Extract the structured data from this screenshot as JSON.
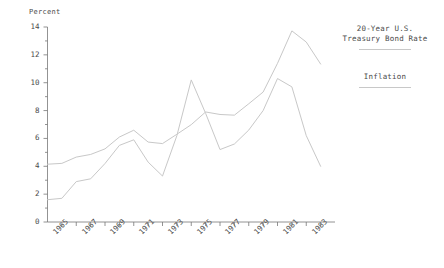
{
  "chart_data": {
    "type": "line",
    "title": "",
    "xlabel": "",
    "ylabel": "Percent",
    "xlim": [
      1964,
      1984
    ],
    "ylim": [
      0,
      14
    ],
    "grid": false,
    "legend_position": "right",
    "x": [
      1964,
      1965,
      1966,
      1967,
      1968,
      1969,
      1970,
      1971,
      1972,
      1973,
      1974,
      1975,
      1976,
      1977,
      1978,
      1979,
      1980,
      1981,
      1982,
      1983
    ],
    "xtick_labels": [
      "1965",
      "1967",
      "1969",
      "1971",
      "1973",
      "1975",
      "1977",
      "1979",
      "1981",
      "1983"
    ],
    "xtick_values": [
      1965,
      1967,
      1969,
      1971,
      1973,
      1975,
      1977,
      1979,
      1981,
      1983
    ],
    "ytick_labels": [
      "0",
      "2",
      "4",
      "6",
      "8",
      "10",
      "12",
      "14"
    ],
    "ytick_values": [
      0,
      2,
      4,
      6,
      8,
      10,
      12,
      14
    ],
    "yminor_values": [
      1,
      3,
      5,
      7,
      9,
      11,
      13
    ],
    "series": [
      {
        "name": "20-Year U.S. Treasury Bond Rate",
        "color": "#c8c8c8",
        "values": [
          4.15,
          4.21,
          4.66,
          4.85,
          5.25,
          6.1,
          6.59,
          5.74,
          5.63,
          6.3,
          6.99,
          7.9,
          7.72,
          7.67,
          8.49,
          9.33,
          11.39,
          13.72,
          12.92,
          11.34
        ]
      },
      {
        "name": "Inflation",
        "color": "#c8c8c8",
        "values": [
          1.6,
          1.7,
          2.9,
          3.1,
          4.2,
          5.5,
          5.9,
          4.3,
          3.3,
          6.2,
          10.2,
          7.8,
          5.2,
          5.6,
          6.6,
          8.0,
          10.3,
          9.7,
          6.2,
          4.0
        ]
      }
    ]
  },
  "legend": {
    "entries": [
      {
        "line1": "20-Year U.S.",
        "line2": "Treasury Bond Rate"
      },
      {
        "line1": "Inflation",
        "line2": ""
      }
    ]
  }
}
